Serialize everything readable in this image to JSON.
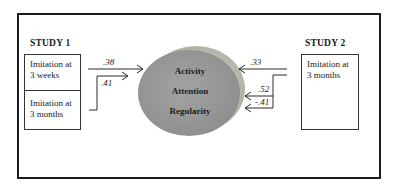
{
  "diagram": {
    "frame_color": "#1c1c1c",
    "study1": {
      "title": "STUDY 1",
      "cells": [
        {
          "line1": "Imitation at",
          "line2": "3 weeks"
        },
        {
          "line1": "Imitation at",
          "line2": "3 months"
        }
      ]
    },
    "study2": {
      "title": "STUDY 2",
      "cells": [
        {
          "line1": "Imitation at",
          "line2": "3 months"
        }
      ]
    },
    "ellipse": {
      "front_color": "#9a9a9a",
      "back_color": "#b9bcae",
      "factors": [
        "Activity",
        "Attention",
        "Regularity"
      ]
    },
    "paths": {
      "study1_3weeks": {
        "coef": ".38",
        "target": "Activity"
      },
      "study1_3months": {
        "coef": ".41",
        "target": "Activity"
      },
      "study2_activity": {
        "coef": ".33",
        "target": "Activity"
      },
      "study2_attention": {
        "coef": ".52",
        "target": "Attention"
      },
      "study2_regularity": {
        "coef": "-.41",
        "target": "Regularity"
      }
    }
  }
}
